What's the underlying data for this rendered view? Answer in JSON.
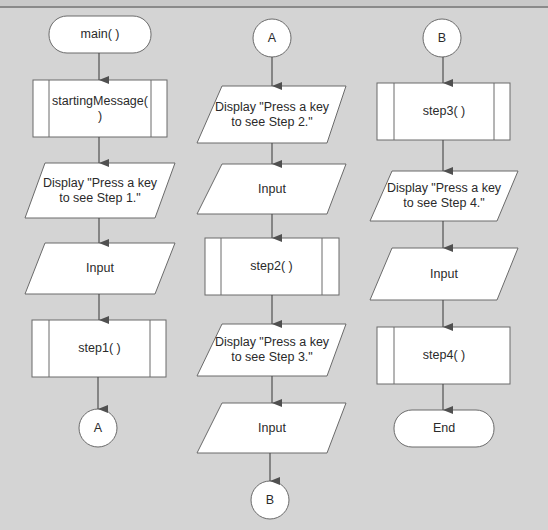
{
  "colors": {
    "background": "#d4d4d4",
    "shape_fill": "#ffffff",
    "stroke": "#6a6a6a",
    "arrow": "#505050",
    "text": "#2a2a2a"
  },
  "columns": [
    {
      "id": "col1",
      "nodes": [
        {
          "type": "terminal",
          "label": "main( )"
        },
        {
          "type": "predefined-process",
          "label": "startingMessage( )"
        },
        {
          "type": "io",
          "label": "Display \"Press a key to see Step 1.\""
        },
        {
          "type": "io",
          "label": "Input"
        },
        {
          "type": "predefined-process",
          "label": "step1( )"
        },
        {
          "type": "connector",
          "label": "A"
        }
      ]
    },
    {
      "id": "col2",
      "nodes": [
        {
          "type": "connector",
          "label": "A"
        },
        {
          "type": "io",
          "label": "Display \"Press a key to see Step 2.\""
        },
        {
          "type": "io",
          "label": "Input"
        },
        {
          "type": "predefined-process",
          "label": "step2( )"
        },
        {
          "type": "io",
          "label": "Display \"Press a key to see Step 3.\""
        },
        {
          "type": "io",
          "label": "Input"
        },
        {
          "type": "connector",
          "label": "B"
        }
      ]
    },
    {
      "id": "col3",
      "nodes": [
        {
          "type": "connector",
          "label": "B"
        },
        {
          "type": "predefined-process",
          "label": "step3( )"
        },
        {
          "type": "io",
          "label": "Display \"Press a key to see Step 4.\""
        },
        {
          "type": "io",
          "label": "Input"
        },
        {
          "type": "predefined-process",
          "label": "step4( )"
        },
        {
          "type": "terminal",
          "label": "End"
        }
      ]
    }
  ]
}
